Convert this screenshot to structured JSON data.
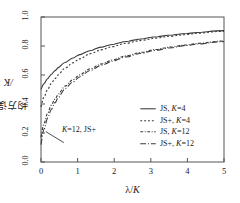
{
  "chart_data": {
    "type": "line",
    "title": "",
    "xlabel": "λ/K",
    "ylabel": "均方误差/K",
    "xlim": [
      0,
      5
    ],
    "ylim": [
      0,
      1
    ],
    "grid": false,
    "legend_position": "lower-right-inside",
    "xticks": [
      "0",
      "1",
      "2",
      "3",
      "4",
      "5"
    ],
    "yticks": [
      "0.0",
      "0.2",
      "0.4",
      "0.6",
      "0.8",
      "1.0"
    ],
    "x": [
      0,
      0.1,
      0.2,
      0.3,
      0.4,
      0.5,
      0.7,
      0.9,
      1.1,
      1.4,
      1.7,
      2.0,
      2.4,
      2.8,
      3.2,
      3.6,
      4.0,
      4.4,
      5.0
    ],
    "series": [
      {
        "name": "JS, K=4",
        "style": "solid",
        "values": [
          0.5,
          0.543,
          0.578,
          0.607,
          0.632,
          0.654,
          0.69,
          0.719,
          0.742,
          0.771,
          0.794,
          0.812,
          0.833,
          0.85,
          0.864,
          0.876,
          0.886,
          0.895,
          0.906
        ]
      },
      {
        "name": "JS+, K=4",
        "style": "dotted",
        "values": [
          0.38,
          0.451,
          0.503,
          0.544,
          0.577,
          0.605,
          0.65,
          0.685,
          0.713,
          0.748,
          0.775,
          0.796,
          0.82,
          0.839,
          0.855,
          0.868,
          0.879,
          0.889,
          0.901
        ]
      },
      {
        "name": "JS, K=12",
        "style": "dashdot-short",
        "values": [
          0.17,
          0.271,
          0.341,
          0.394,
          0.436,
          0.471,
          0.527,
          0.569,
          0.603,
          0.645,
          0.678,
          0.704,
          0.734,
          0.757,
          0.777,
          0.793,
          0.807,
          0.819,
          0.834
        ]
      },
      {
        "name": "JS+, K=12",
        "style": "dashdot-long",
        "values": [
          0.12,
          0.231,
          0.308,
          0.366,
          0.411,
          0.449,
          0.509,
          0.554,
          0.59,
          0.634,
          0.668,
          0.696,
          0.727,
          0.751,
          0.771,
          0.788,
          0.803,
          0.815,
          0.83
        ]
      }
    ],
    "annotations": [
      {
        "text": "K=12, JS+",
        "target_x": 0.13,
        "target_y": 0.21
      }
    ]
  },
  "axes": {
    "ylabel_text": "均方误差",
    "ylabel_suffix": "/K",
    "xlabel_lambda": "λ",
    "xlabel_slash": "/",
    "xlabel_k": "K",
    "ytick_labels": [
      "0.0",
      "0.2",
      "0.4",
      "0.6",
      "0.8",
      "1.0"
    ],
    "xtick_labels": [
      "0",
      "1",
      "2",
      "3",
      "4",
      "5"
    ]
  },
  "legend": {
    "entries": [
      {
        "prefix": "JS, ",
        "italic": "K",
        "suffix": "=4"
      },
      {
        "prefix": "JS+, ",
        "italic": "K",
        "suffix": "=4"
      },
      {
        "prefix": "JS, ",
        "italic": "K",
        "suffix": "=12"
      },
      {
        "prefix": "JS+, ",
        "italic": "K",
        "suffix": "=12"
      }
    ]
  },
  "annotation": {
    "italic": "K",
    "text": "=12, JS+"
  },
  "colors": {
    "line": "#3a3a3a",
    "frame": "#555555",
    "background": "#ffffff",
    "text": "#1a1a1a"
  }
}
